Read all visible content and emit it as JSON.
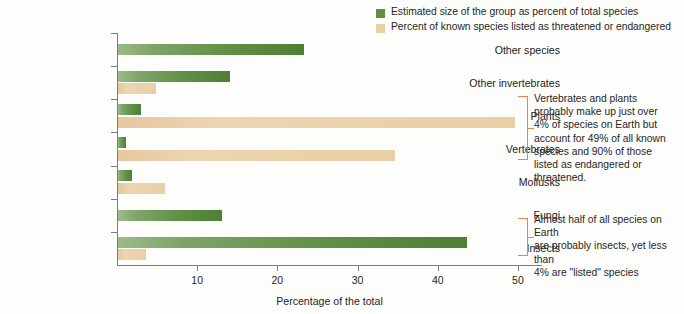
{
  "chart_data": {
    "type": "bar",
    "orientation": "horizontal",
    "title": "",
    "xlabel": "Percentage of the total",
    "ylabel": "",
    "xlim": [
      0,
      53
    ],
    "xticks": [
      10,
      20,
      30,
      40,
      50
    ],
    "grid": false,
    "legend_position": "top-right",
    "categories": [
      "Other species",
      "Other invertebrates",
      "Plants",
      "Vertebrates",
      "Mollusks",
      "Fungi",
      "Insects"
    ],
    "series": [
      {
        "name": "Estimated size of the group as percent of total species",
        "color": "#5f8e44",
        "values": [
          23.2,
          14.0,
          2.9,
          1.0,
          1.7,
          13.0,
          43.5
        ]
      },
      {
        "name": "Percent of known species listed as threatened or endangered",
        "color": "#e9cfa6",
        "values": [
          0,
          4.7,
          49.5,
          34.5,
          5.8,
          0,
          3.5
        ]
      }
    ],
    "annotations": [
      {
        "id": "vertebrates-plants-note",
        "text": "Vertebrates and plants probably make up just over 4% of species on Earth but account for 49% of all known species and 90% of those listed as endangered or threatened.",
        "lines": [
          "Vertebrates and plants",
          "probably make up just over",
          "4% of species on Earth but",
          "account for 49% of all known",
          "species and 90% of those",
          "listed as endangered or",
          "threatened."
        ],
        "targets": [
          "Plants",
          "Vertebrates"
        ],
        "bracket_color": "#e8824f"
      },
      {
        "id": "insects-note",
        "text": "Almost half of all species on Earth are probably insects, yet less than 4% are \"listed\" species",
        "lines": [
          "Almost half of all species on Earth",
          "are probably insects, yet less than",
          "4% are \"listed\" species"
        ],
        "targets": [
          "Insects"
        ],
        "bracket_color": "#e8824f"
      }
    ]
  },
  "legend": {
    "items": [
      {
        "label": "Estimated size of the group as percent of total species",
        "color": "#5f8e44"
      },
      {
        "label": "Percent of known species listed as threatened or endangered",
        "color": "#e9cfa6"
      }
    ]
  },
  "axis": {
    "x_title": "Percentage of the total",
    "tick_labels": [
      "10",
      "20",
      "30",
      "40",
      "50"
    ]
  }
}
